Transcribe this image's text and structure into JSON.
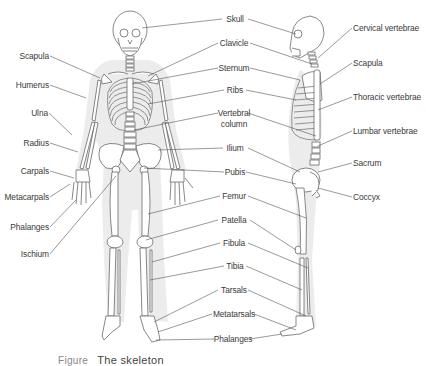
{
  "diagram": {
    "views": [
      "anterior (front) view",
      "lateral (side) view"
    ],
    "colors": {
      "background": "#ffffff",
      "bone_outline": "#6a6a6a",
      "bone_fill": "#ffffff",
      "shadow": "#e4e4e4",
      "leader_line": "#555555",
      "label_text": "#3a3a3a"
    },
    "labels_left": [
      {
        "id": "scapula",
        "text": "Scapula"
      },
      {
        "id": "humerus",
        "text": "Humerus"
      },
      {
        "id": "ulna",
        "text": "Ulna"
      },
      {
        "id": "radius",
        "text": "Radius"
      },
      {
        "id": "carpals",
        "text": "Carpals"
      },
      {
        "id": "metacarpals",
        "text": "Metacarpals"
      },
      {
        "id": "phalanges_hand",
        "text": "Phalanges"
      },
      {
        "id": "ischium",
        "text": "Ischium"
      }
    ],
    "labels_center": [
      {
        "id": "skull",
        "text": "Skull"
      },
      {
        "id": "clavicle",
        "text": "Clavicle"
      },
      {
        "id": "sternum",
        "text": "Sternum"
      },
      {
        "id": "ribs",
        "text": "Ribs"
      },
      {
        "id": "vertebral_column_1",
        "text": "Vertebral"
      },
      {
        "id": "vertebral_column_2",
        "text": "column"
      },
      {
        "id": "ilium",
        "text": "Ilium"
      },
      {
        "id": "pubis",
        "text": "Pubis"
      },
      {
        "id": "femur",
        "text": "Femur"
      },
      {
        "id": "patella",
        "text": "Patella"
      },
      {
        "id": "fibula",
        "text": "Fibula"
      },
      {
        "id": "tibia",
        "text": "Tibia"
      },
      {
        "id": "tarsals",
        "text": "Tarsals"
      },
      {
        "id": "metatarsals",
        "text": "Metatarsals"
      },
      {
        "id": "phalanges_foot",
        "text": "Phalanges"
      }
    ],
    "labels_right": [
      {
        "id": "cervical_vertebrae",
        "text": "Cervical vertebrae"
      },
      {
        "id": "scapula_side",
        "text": "Scapula"
      },
      {
        "id": "thoracic_vertebrae",
        "text": "Thoracic vertebrae"
      },
      {
        "id": "lumbar_vertebrae",
        "text": "Lumbar vertebrae"
      },
      {
        "id": "sacrum",
        "text": "Sacrum"
      },
      {
        "id": "coccyx",
        "text": "Coccyx"
      }
    ],
    "caption": {
      "figure_number": "Figure",
      "title": "The skeleton",
      "note": "caption partially cut off at bottom edge"
    }
  }
}
